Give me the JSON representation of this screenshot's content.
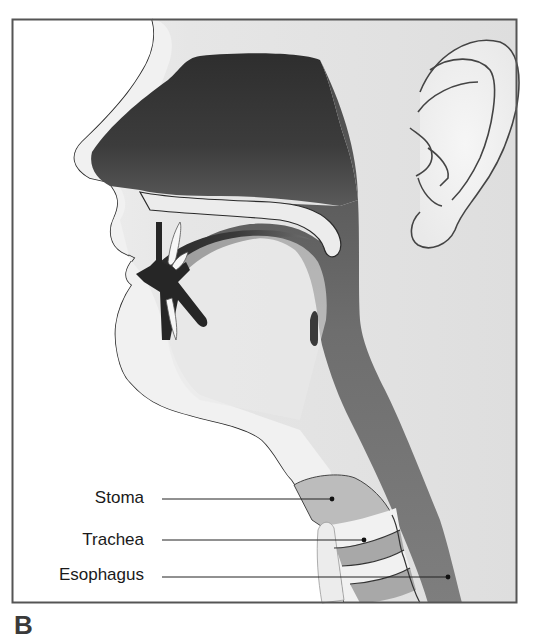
{
  "figure": {
    "panel_letter": "B",
    "labels": [
      {
        "id": "stoma",
        "text": "Stoma"
      },
      {
        "id": "trachea",
        "text": "Trachea"
      },
      {
        "id": "esophagus",
        "text": "Esophagus"
      }
    ],
    "colors": {
      "frame": "#555555",
      "background": "#e4e4e4",
      "skin_light": "#f4f4f4",
      "cavity_dark": "#3a3a3a",
      "airway_mid": "#7c7c7c",
      "outline": "#2a2a2a"
    }
  }
}
